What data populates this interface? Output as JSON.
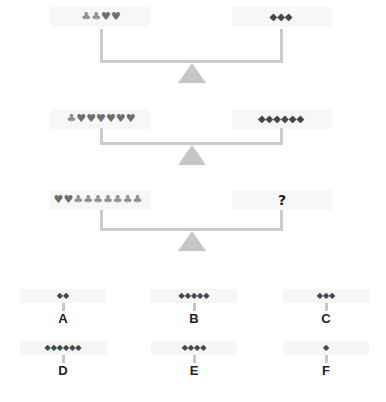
{
  "puzzle": {
    "rows": [
      {
        "left": {
          "items": [
            {
              "suit": "club",
              "glyph": "♣"
            },
            {
              "suit": "club",
              "glyph": "♣"
            },
            {
              "suit": "heart",
              "glyph": "♥"
            },
            {
              "suit": "heart",
              "glyph": "♥"
            }
          ]
        },
        "right": {
          "items": [
            {
              "suit": "diamond",
              "glyph": "◆"
            },
            {
              "suit": "diamond",
              "glyph": "◆"
            },
            {
              "suit": "diamond",
              "glyph": "◆"
            }
          ]
        }
      },
      {
        "left": {
          "items": [
            {
              "suit": "club",
              "glyph": "♣"
            },
            {
              "suit": "heart",
              "glyph": "♥"
            },
            {
              "suit": "heart",
              "glyph": "♥"
            },
            {
              "suit": "heart",
              "glyph": "♥"
            },
            {
              "suit": "heart",
              "glyph": "♥"
            },
            {
              "suit": "heart",
              "glyph": "♥"
            },
            {
              "suit": "heart",
              "glyph": "♥"
            }
          ]
        },
        "right": {
          "items": [
            {
              "suit": "diamond",
              "glyph": "◆"
            },
            {
              "suit": "diamond",
              "glyph": "◆"
            },
            {
              "suit": "diamond",
              "glyph": "◆"
            },
            {
              "suit": "diamond",
              "glyph": "◆"
            },
            {
              "suit": "diamond",
              "glyph": "◆"
            },
            {
              "suit": "diamond",
              "glyph": "◆"
            }
          ]
        }
      },
      {
        "left": {
          "items": [
            {
              "suit": "heart",
              "glyph": "♥"
            },
            {
              "suit": "heart",
              "glyph": "♥"
            },
            {
              "suit": "club",
              "glyph": "♣"
            },
            {
              "suit": "club",
              "glyph": "♣"
            },
            {
              "suit": "club",
              "glyph": "♣"
            },
            {
              "suit": "club",
              "glyph": "♣"
            },
            {
              "suit": "club",
              "glyph": "♣"
            },
            {
              "suit": "club",
              "glyph": "♣"
            },
            {
              "suit": "club",
              "glyph": "♣"
            }
          ]
        },
        "right": {
          "unknown": "?"
        }
      }
    ]
  },
  "options": [
    {
      "label": "A",
      "diamonds": 2,
      "glyphs": "◆◆"
    },
    {
      "label": "B",
      "diamonds": 5,
      "glyphs": "◆◆◆◆◆"
    },
    {
      "label": "C",
      "diamonds": 3,
      "glyphs": "◆◆◆"
    },
    {
      "label": "D",
      "diamonds": 6,
      "glyphs": "◆◆◆◆◆◆"
    },
    {
      "label": "E",
      "diamonds": 4,
      "glyphs": "◆◆◆◆"
    },
    {
      "label": "F",
      "diamonds": 1,
      "glyphs": "◆"
    }
  ],
  "colors": {
    "club": "#909090",
    "heart": "#6e6e6e",
    "diamond": "#474747",
    "scale": "#cbcbcb",
    "panel": "#f7f7f7"
  }
}
